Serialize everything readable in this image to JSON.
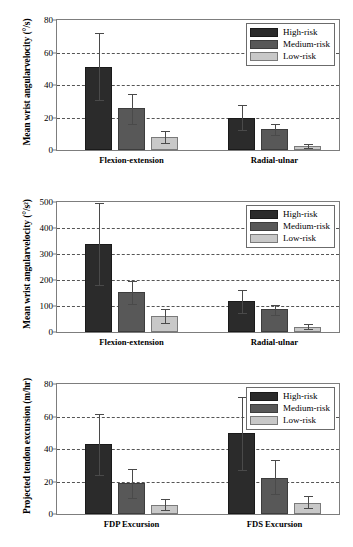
{
  "chart_data": [
    {
      "type": "bar",
      "title": "",
      "xlabel": "",
      "ylabel": "Mean wrist angularvelocity (°/s)",
      "ylim": [
        0,
        80
      ],
      "yticks": [
        "0",
        "20",
        "40",
        "60",
        "80"
      ],
      "grid": true,
      "legend_position": "top-right",
      "categories": [
        "Flexion-extension",
        "Radial-ulnar"
      ],
      "series": [
        {
          "name": "High-risk",
          "values": [
            51.2,
            19.5
          ],
          "err_low": [
            31.0,
            12.2
          ],
          "err_high": [
            71.8,
            28.0
          ]
        },
        {
          "name": "Medium-risk",
          "values": [
            25.8,
            12.9
          ],
          "err_low": [
            16.0,
            9.2
          ],
          "err_high": [
            34.5,
            16.3
          ]
        },
        {
          "name": "Low-risk",
          "values": [
            7.9,
            2.5
          ],
          "err_low": [
            4.2,
            1.5
          ],
          "err_high": [
            12.0,
            3.8
          ]
        }
      ]
    },
    {
      "type": "bar",
      "title": "",
      "xlabel": "",
      "ylabel": "Mean wrist angularvelocity (°/s²)",
      "ylim": [
        0,
        500
      ],
      "yticks": [
        "0",
        "100",
        "200",
        "300",
        "400",
        "500"
      ],
      "grid": true,
      "legend_position": "top-right",
      "categories": [
        "Flexion-extension",
        "Radial-ulnar"
      ],
      "series": [
        {
          "name": "High-risk",
          "values": [
            340,
            118
          ],
          "err_low": [
            181,
            73
          ],
          "err_high": [
            497,
            163
          ]
        },
        {
          "name": "Medium-risk",
          "values": [
            155,
            88
          ],
          "err_low": [
            108,
            67
          ],
          "err_high": [
            197,
            105
          ]
        },
        {
          "name": "Low-risk",
          "values": [
            62,
            20
          ],
          "err_low": [
            33,
            10
          ],
          "err_high": [
            90,
            32
          ]
        }
      ]
    },
    {
      "type": "bar",
      "title": "",
      "xlabel": "",
      "ylabel": "Projected tendon excursion (m/hr)",
      "ylim": [
        0,
        80
      ],
      "yticks": [
        "0",
        "20",
        "40",
        "60",
        "80"
      ],
      "grid": true,
      "legend_position": "top-right",
      "categories": [
        "FDP Excursion",
        "FDS Excursion"
      ],
      "series": [
        {
          "name": "High-risk",
          "values": [
            42.8,
            49.8
          ],
          "err_low": [
            24.0,
            27.0
          ],
          "err_high": [
            61.5,
            72.0
          ]
        },
        {
          "name": "Medium-risk",
          "values": [
            19.0,
            22.2
          ],
          "err_low": [
            9.6,
            12.2
          ],
          "err_high": [
            28.0,
            33.0
          ]
        },
        {
          "name": "Low-risk",
          "values": [
            5.6,
            6.9
          ],
          "err_low": [
            2.6,
            3.4
          ],
          "err_high": [
            9.0,
            11.0
          ]
        }
      ]
    }
  ],
  "colors": {
    "high_risk": "#2b2b2b",
    "medium_risk": "#585858",
    "low_risk": "#c8c8c8",
    "axis": "#7d7d7d",
    "grid": "#555555"
  }
}
